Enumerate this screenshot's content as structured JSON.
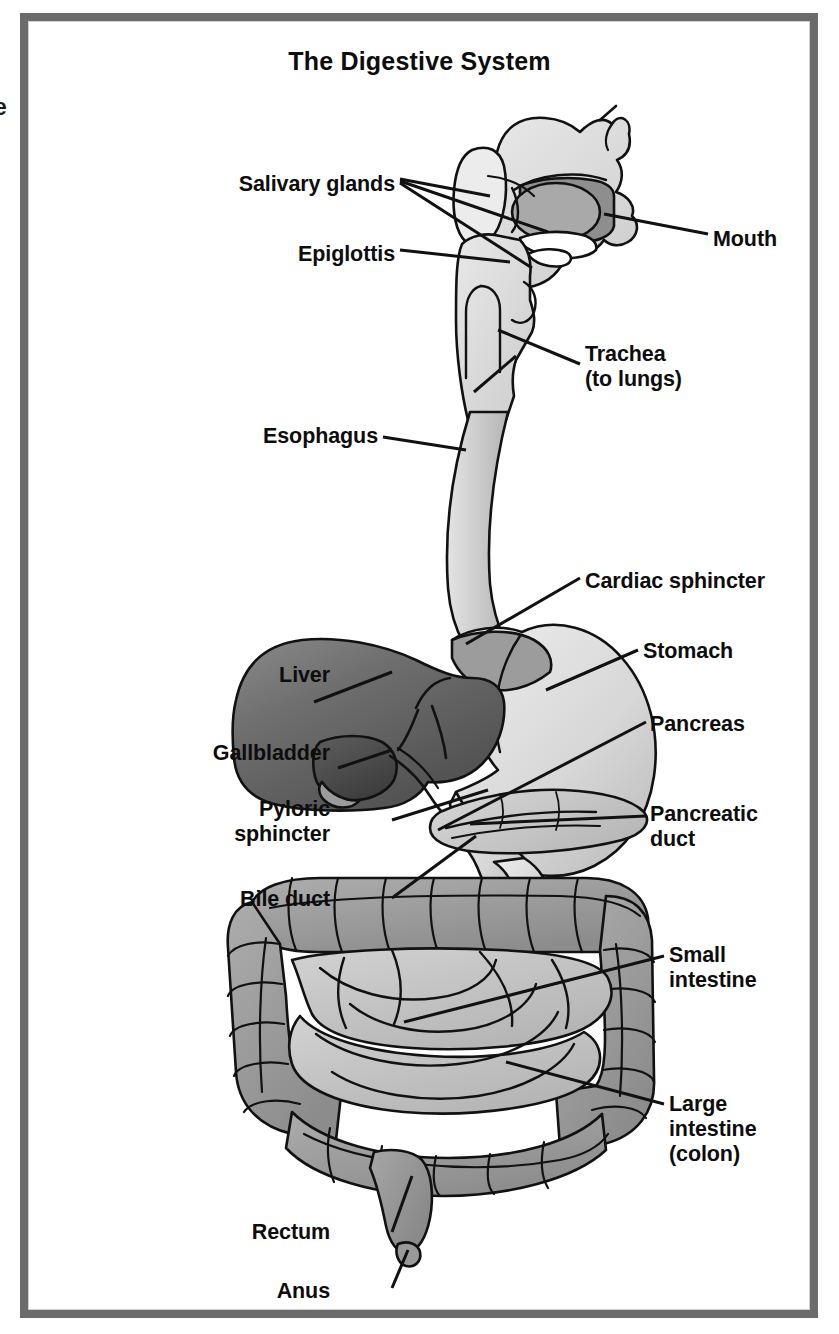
{
  "figure": {
    "title": "The Digestive System",
    "type": "anatomical-diagram",
    "edge_bleed_text": "e",
    "frame_color": "#6b6b6b",
    "background_color": "#ffffff",
    "label_color": "#0d0d0d"
  },
  "palette": {
    "liver_dark": "#6d6d6d",
    "liver_shadow": "#555555",
    "gallbladder": "#4f4f4f",
    "stomach_light": "#d9d9d9",
    "stomach_shade": "#bdbdbd",
    "esophagus": "#cfcfcf",
    "pancreas": "#c9c9c9",
    "colon_gray": "#9b9b9b",
    "small_intestine": "#c2c2c2",
    "tongue_gray": "#a8a8a8",
    "oral_cavity": "#8c8c8c",
    "head_outline": "#111111",
    "leader_line": "#111111"
  },
  "labels_left": [
    {
      "name": "salivary-glands",
      "text": "Salivary glands",
      "x": 395,
      "y": 172,
      "lines": 1
    },
    {
      "name": "epiglottis",
      "text": "Epiglottis",
      "x": 395,
      "y": 242,
      "lines": 1
    },
    {
      "name": "esophagus",
      "text": "Esophagus",
      "x": 378,
      "y": 424,
      "lines": 1
    },
    {
      "name": "liver",
      "text": "Liver",
      "x": 330,
      "y": 663,
      "lines": 1
    },
    {
      "name": "gallbladder",
      "text": "Gallbladder",
      "x": 330,
      "y": 741,
      "lines": 1
    },
    {
      "name": "pyloric-sphincter",
      "text": "Pyloric\nsphincter",
      "x": 330,
      "y": 797,
      "lines": 2
    },
    {
      "name": "bile-duct",
      "text": "Bile duct",
      "x": 330,
      "y": 887,
      "lines": 1
    },
    {
      "name": "rectum",
      "text": "Rectum",
      "x": 330,
      "y": 1220,
      "lines": 1
    },
    {
      "name": "anus",
      "text": "Anus",
      "x": 330,
      "y": 1279,
      "lines": 1
    }
  ],
  "labels_right": [
    {
      "name": "mouth",
      "text": "Mouth",
      "x": 713,
      "y": 227,
      "lines": 1
    },
    {
      "name": "trachea",
      "text": "Trachea\n(to lungs)",
      "x": 585,
      "y": 355,
      "lines": 2
    },
    {
      "name": "cardiac-sphincter",
      "text": "Cardiac sphincter",
      "x": 585,
      "y": 569,
      "lines": 1
    },
    {
      "name": "stomach",
      "text": "Stomach",
      "x": 643,
      "y": 639,
      "lines": 1
    },
    {
      "name": "pancreas",
      "text": "Pancreas",
      "x": 650,
      "y": 712,
      "lines": 1
    },
    {
      "name": "pancreatic-duct",
      "text": "Pancreatic\nduct",
      "x": 650,
      "y": 802,
      "lines": 2
    },
    {
      "name": "small-intestine",
      "text": "Small\nintestine",
      "x": 669,
      "y": 943,
      "lines": 2
    },
    {
      "name": "large-intestine",
      "text": "Large\nintestine\n(colon)",
      "x": 669,
      "y": 1092,
      "lines": 3
    }
  ],
  "organs": [
    {
      "name": "salivary-gland",
      "label": "Salivary glands"
    },
    {
      "name": "epiglottis",
      "label": "Epiglottis"
    },
    {
      "name": "mouth",
      "label": "Mouth"
    },
    {
      "name": "trachea",
      "label": "Trachea (to lungs)"
    },
    {
      "name": "esophagus",
      "label": "Esophagus"
    },
    {
      "name": "cardiac-sphincter",
      "label": "Cardiac sphincter"
    },
    {
      "name": "stomach",
      "label": "Stomach"
    },
    {
      "name": "liver",
      "label": "Liver"
    },
    {
      "name": "gallbladder",
      "label": "Gallbladder"
    },
    {
      "name": "bile-duct",
      "label": "Bile duct"
    },
    {
      "name": "pyloric-sphincter",
      "label": "Pyloric sphincter"
    },
    {
      "name": "pancreas",
      "label": "Pancreas"
    },
    {
      "name": "pancreatic-duct",
      "label": "Pancreatic duct"
    },
    {
      "name": "small-intestine",
      "label": "Small intestine"
    },
    {
      "name": "large-intestine",
      "label": "Large intestine (colon)"
    },
    {
      "name": "rectum",
      "label": "Rectum"
    },
    {
      "name": "anus",
      "label": "Anus"
    }
  ]
}
